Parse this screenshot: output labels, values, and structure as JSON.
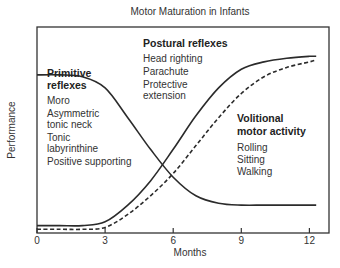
{
  "chart_data": {
    "type": "line",
    "title": "Motor Maturation in Infants",
    "xlabel": "Months",
    "ylabel": "Performance",
    "xlim": [
      0,
      13
    ],
    "ylim": [
      0,
      1
    ],
    "x_ticks": [
      0,
      3,
      6,
      9,
      12
    ],
    "x_tick_labels": [
      "0",
      "3",
      "6",
      "9",
      "12"
    ],
    "y_ticks": [],
    "grid": false,
    "legend": "none (inline annotations)",
    "series": [
      {
        "name": "Primitive reflexes",
        "style": "solid",
        "x": [
          0,
          1,
          2,
          3,
          4,
          5,
          6,
          7,
          8,
          9,
          10,
          11,
          12,
          12.3
        ],
        "values": [
          0.85,
          0.85,
          0.84,
          0.78,
          0.62,
          0.45,
          0.3,
          0.2,
          0.16,
          0.15,
          0.15,
          0.15,
          0.15,
          0.15
        ]
      },
      {
        "name": "Postural reflexes",
        "style": "solid",
        "x": [
          0,
          1,
          2,
          3,
          4,
          5,
          6,
          7,
          8,
          9,
          10,
          11,
          12,
          12.3
        ],
        "values": [
          0.04,
          0.04,
          0.04,
          0.06,
          0.15,
          0.28,
          0.45,
          0.63,
          0.78,
          0.88,
          0.92,
          0.94,
          0.95,
          0.95
        ]
      },
      {
        "name": "Volitional motor activity",
        "style": "dashed",
        "x": [
          0,
          1,
          2,
          3,
          4,
          5,
          6,
          7,
          8,
          9,
          10,
          11,
          12,
          12.3
        ],
        "values": [
          0.02,
          0.02,
          0.02,
          0.03,
          0.1,
          0.2,
          0.32,
          0.47,
          0.62,
          0.75,
          0.84,
          0.89,
          0.92,
          0.93
        ]
      }
    ],
    "annotations": [
      {
        "heading": [
          "Primitive",
          "reflexes"
        ],
        "items": [
          "Moro",
          "Asymmetric",
          "tonic neck",
          "Tonic",
          "labyrinthine",
          "Positive supporting"
        ]
      },
      {
        "heading": [
          "Postural reflexes"
        ],
        "items": [
          "Head righting",
          "Parachute",
          "Protective",
          "extension"
        ]
      },
      {
        "heading": [
          "Volitional",
          "motor activity"
        ],
        "items": [
          "Rolling",
          "Sitting",
          "Walking"
        ]
      }
    ]
  },
  "colors": {
    "line": "#2b2b2b",
    "frame": "#333333",
    "text": "#333333"
  }
}
